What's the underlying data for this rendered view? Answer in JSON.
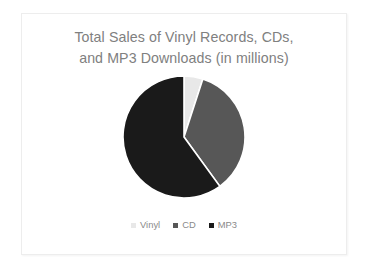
{
  "slide": {
    "background_color": "#ffffff",
    "card_background_color": "#ffffff",
    "card_border_color": "#ededed"
  },
  "chart_data": {
    "type": "pie",
    "title": "Total Sales of Vinyl Records, CDs, and MP3 Downloads (in millions)",
    "title_lines": [
      "Total Sales of Vinyl Records, CDs,",
      "and MP3 Downloads (in millions)"
    ],
    "title_color": "#808080",
    "categories": [
      "Vinyl",
      "CD",
      "MP3"
    ],
    "values": [
      5,
      35,
      60
    ],
    "units": "millions",
    "colors": [
      "#e8e8e8",
      "#575757",
      "#1a1a1a"
    ],
    "start_angle_deg": 0,
    "direction": "clockwise",
    "slices": [
      {
        "label": "Vinyl",
        "value": 5,
        "percent": 5,
        "color": "#e8e8e8",
        "start_angle_deg": 0,
        "end_angle_deg": 18
      },
      {
        "label": "CD",
        "value": 35,
        "percent": 35,
        "color": "#575757",
        "start_angle_deg": 18,
        "end_angle_deg": 144
      },
      {
        "label": "MP3",
        "value": 60,
        "percent": 60,
        "color": "#1a1a1a",
        "start_angle_deg": 144,
        "end_angle_deg": 360
      }
    ],
    "legend": {
      "position": "bottom",
      "label_color": "#8a8a8a",
      "entries": [
        {
          "label": "Vinyl",
          "color": "#e8e8e8"
        },
        {
          "label": "CD",
          "color": "#575757"
        },
        {
          "label": "MP3",
          "color": "#1a1a1a"
        }
      ]
    },
    "data_labels": false,
    "grid": false,
    "xlabel": "",
    "ylabel": ""
  }
}
